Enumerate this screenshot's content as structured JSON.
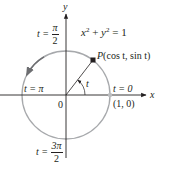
{
  "colors": {
    "axis": "#231f20",
    "circle": "#a7a9ac",
    "arc_arrow": "#6d6e71",
    "point": "#231f20",
    "endpoint": "#bcbec0",
    "radius": "#231f20"
  },
  "axes": {
    "x_label": "x",
    "y_label": "y",
    "origin_label": "0"
  },
  "equation": {
    "lhs_x": "x",
    "exp1": "2",
    "plus": " + ",
    "lhs_y": "y",
    "exp2": "2",
    "rhs": " = 1"
  },
  "point_label": {
    "name": "P",
    "text": "(cos t, sin t)"
  },
  "angle_label": "t",
  "annotations": {
    "t_pi_over_2": {
      "prefix": "t = ",
      "num": "π",
      "den": "2"
    },
    "t_pi": {
      "text": "t = π"
    },
    "t_zero": {
      "text": "t = 0"
    },
    "point_1_0": {
      "text": "(1, 0)"
    },
    "t_3pi_over_2": {
      "prefix": "t = ",
      "num": "3π",
      "den": "2"
    }
  },
  "geometry": {
    "center": [
      66,
      95
    ],
    "radius": 44,
    "point_angle_deg": 52
  }
}
